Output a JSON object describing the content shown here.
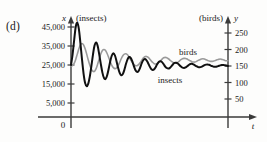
{
  "figure": {
    "part_label": "(d)",
    "background": "#fdfdfc"
  },
  "chart_data": {
    "type": "line",
    "title": "",
    "subtitle": "",
    "xlabel": "t",
    "ylabel": "x",
    "y2label": "y",
    "left_axis_unit": "(insects)",
    "right_axis_unit": "(birds)",
    "origin_label": "0",
    "grid": false,
    "legend_position": "inline-annotation",
    "xlim": [
      0,
      100
    ],
    "ylim": [
      0,
      50000
    ],
    "y2lim": [
      0,
      275
    ],
    "left_ticks": [
      "5,000",
      "15,000",
      "25,000",
      "35,000",
      "45,000"
    ],
    "left_tick_values": [
      5000,
      15000,
      25000,
      35000,
      45000
    ],
    "right_ticks": [
      "50",
      "100",
      "150",
      "200",
      "250"
    ],
    "right_tick_values": [
      50,
      100,
      150,
      200,
      250
    ],
    "xticks": [],
    "annotations": [
      {
        "text": "birds",
        "x": 66,
        "y": 185
      },
      {
        "text": "insects",
        "x": 52,
        "y": 133
      }
    ],
    "series": [
      {
        "name": "insects",
        "color": "#111111",
        "width": 2.0,
        "axis": "left",
        "values": [
          25000,
          30500,
          38000,
          45000,
          47200,
          44000,
          36500,
          28000,
          20500,
          15500,
          13800,
          15200,
          19000,
          24500,
          30500,
          35200,
          36800,
          35000,
          30500,
          25500,
          21000,
          18200,
          17600,
          19500,
          23000,
          27000,
          30000,
          31200,
          30000,
          27000,
          23500,
          20800,
          19600,
          20200,
          22500,
          25500,
          28000,
          29200,
          28800,
          27000,
          24500,
          22400,
          21400,
          21800,
          23500,
          25800,
          27500,
          28100,
          27600,
          26200,
          24400,
          23000,
          22400,
          22800,
          24000,
          25600,
          26700,
          27000,
          26500,
          25400,
          24200,
          23400,
          23100,
          23500,
          24400,
          25400,
          26100,
          26200,
          25800,
          25000,
          24200,
          23600,
          23400,
          23700,
          24300,
          25000,
          25500,
          25600,
          25300,
          24800,
          24300,
          23900,
          23800,
          24000,
          24400,
          24900,
          25200,
          25300,
          25100,
          24700,
          24400,
          24100,
          24050,
          24200,
          24500,
          24800,
          25000,
          25050,
          24900,
          24700,
          24500
        ]
      },
      {
        "name": "birds",
        "color": "#9a9a9a",
        "width": 1.6,
        "axis": "right",
        "values": [
          150,
          152,
          158,
          170,
          186,
          202,
          214,
          218,
          214,
          202,
          186,
          168,
          152,
          140,
          134,
          134,
          142,
          156,
          172,
          187,
          197,
          200,
          197,
          188,
          176,
          163,
          152,
          145,
          142,
          144,
          151,
          161,
          172,
          181,
          186,
          187,
          184,
          177,
          169,
          161,
          155,
          151,
          151,
          154,
          160,
          167,
          174,
          178,
          179,
          177,
          172,
          166,
          161,
          157,
          156,
          157,
          161,
          166,
          171,
          175,
          176,
          175,
          172,
          168,
          164,
          161,
          159,
          159,
          161,
          165,
          169,
          172,
          173,
          173,
          171,
          168,
          166,
          163,
          162,
          162,
          164,
          167,
          169,
          171,
          172,
          171,
          169,
          167,
          165,
          164,
          164,
          165,
          167,
          169,
          170,
          171,
          170,
          169,
          167,
          166,
          166
        ]
      }
    ]
  }
}
